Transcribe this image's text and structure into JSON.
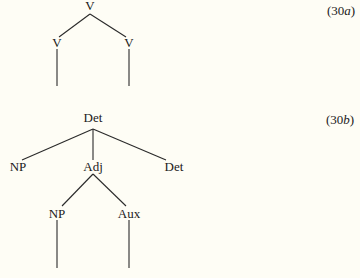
{
  "diagrams": [
    {
      "label_prefix": "(30",
      "label_letter": "a",
      "label_suffix": ")",
      "nodes": [
        {
          "id": "root",
          "text": "V"
        },
        {
          "id": "left",
          "text": "V"
        },
        {
          "id": "right",
          "text": "V"
        }
      ]
    },
    {
      "label_prefix": "(30",
      "label_letter": "b",
      "label_suffix": ")",
      "nodes": [
        {
          "id": "root",
          "text": "Det"
        },
        {
          "id": "np1",
          "text": "NP"
        },
        {
          "id": "adj",
          "text": "Adj"
        },
        {
          "id": "det2",
          "text": "Det"
        },
        {
          "id": "np2",
          "text": "NP"
        },
        {
          "id": "aux",
          "text": "Aux"
        }
      ]
    }
  ]
}
